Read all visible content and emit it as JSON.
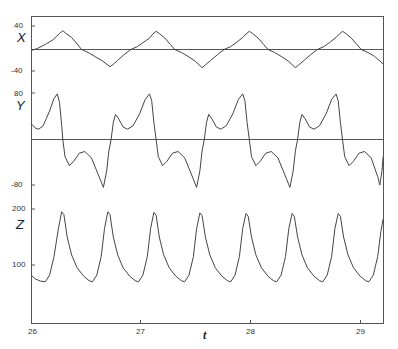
{
  "chart_data": {
    "type": "line",
    "title": "",
    "xlabel": "t",
    "xlim": [
      26,
      29.21
    ],
    "x_ticks": [
      26,
      27,
      28,
      29
    ],
    "grid": false,
    "legend": null,
    "panels": [
      {
        "name": "X",
        "label": "X",
        "ylim": [
          -40,
          40
        ],
        "y_ticks": [
          40,
          -40
        ],
        "zero_line": true,
        "series": [
          [
            26.0,
            -2
          ],
          [
            26.06,
            2
          ],
          [
            26.13,
            9
          ],
          [
            26.2,
            17
          ],
          [
            26.26,
            28
          ],
          [
            26.29,
            33
          ],
          [
            26.32,
            28
          ],
          [
            26.37,
            21
          ],
          [
            26.42,
            10
          ],
          [
            26.46,
            0
          ],
          [
            26.52,
            -5
          ],
          [
            26.58,
            -12
          ],
          [
            26.65,
            -20
          ],
          [
            26.72,
            -30
          ],
          [
            26.75,
            -26
          ],
          [
            26.79,
            -19
          ],
          [
            26.85,
            -9
          ],
          [
            26.91,
            0
          ],
          [
            26.97,
            5
          ],
          [
            27.02,
            12
          ],
          [
            27.08,
            20
          ],
          [
            27.11,
            27
          ],
          [
            27.14,
            32
          ],
          [
            27.17,
            28
          ],
          [
            27.22,
            20
          ],
          [
            27.27,
            9
          ],
          [
            27.31,
            0
          ],
          [
            27.37,
            -5
          ],
          [
            27.43,
            -12
          ],
          [
            27.5,
            -21
          ],
          [
            27.56,
            -32
          ],
          [
            27.59,
            -27
          ],
          [
            27.64,
            -19
          ],
          [
            27.7,
            -9
          ],
          [
            27.76,
            0
          ],
          [
            27.82,
            5
          ],
          [
            27.87,
            12
          ],
          [
            27.93,
            21
          ],
          [
            27.96,
            27
          ],
          [
            27.99,
            32
          ],
          [
            28.02,
            28
          ],
          [
            28.07,
            20
          ],
          [
            28.12,
            9
          ],
          [
            28.16,
            0
          ],
          [
            28.22,
            -5
          ],
          [
            28.28,
            -12
          ],
          [
            28.35,
            -21
          ],
          [
            28.41,
            -32
          ],
          [
            28.44,
            -27
          ],
          [
            28.49,
            -19
          ],
          [
            28.55,
            -9
          ],
          [
            28.61,
            0
          ],
          [
            28.67,
            5
          ],
          [
            28.72,
            12
          ],
          [
            28.78,
            21
          ],
          [
            28.81,
            27
          ],
          [
            28.84,
            32
          ],
          [
            28.87,
            28
          ],
          [
            28.92,
            20
          ],
          [
            28.97,
            9
          ],
          [
            29.01,
            0
          ],
          [
            29.07,
            -5
          ],
          [
            29.13,
            -12
          ],
          [
            29.21,
            -25
          ]
        ]
      },
      {
        "name": "Y",
        "label": "Y",
        "ylim": [
          -80,
          80
        ],
        "y_ticks": [
          80,
          -80
        ],
        "zero_line": true,
        "series": [
          [
            26.0,
            28
          ],
          [
            26.04,
            20
          ],
          [
            26.07,
            18
          ],
          [
            26.11,
            24
          ],
          [
            26.17,
            50
          ],
          [
            26.21,
            72
          ],
          [
            26.24,
            80
          ],
          [
            26.26,
            65
          ],
          [
            26.28,
            25
          ],
          [
            26.29,
            0
          ],
          [
            26.31,
            -30
          ],
          [
            26.35,
            -46
          ],
          [
            26.39,
            -38
          ],
          [
            26.44,
            -24
          ],
          [
            26.49,
            -21
          ],
          [
            26.55,
            -32
          ],
          [
            26.61,
            -60
          ],
          [
            26.66,
            -84
          ],
          [
            26.69,
            -55
          ],
          [
            26.71,
            -20
          ],
          [
            26.73,
            0
          ],
          [
            26.75,
            30
          ],
          [
            26.77,
            44
          ],
          [
            26.8,
            36
          ],
          [
            26.84,
            22
          ],
          [
            26.88,
            18
          ],
          [
            26.93,
            24
          ],
          [
            26.99,
            45
          ],
          [
            27.04,
            70
          ],
          [
            27.08,
            80
          ],
          [
            27.1,
            68
          ],
          [
            27.12,
            30
          ],
          [
            27.14,
            0
          ],
          [
            27.16,
            -30
          ],
          [
            27.2,
            -46
          ],
          [
            27.24,
            -38
          ],
          [
            27.29,
            -24
          ],
          [
            27.34,
            -21
          ],
          [
            27.4,
            -32
          ],
          [
            27.46,
            -60
          ],
          [
            27.51,
            -84
          ],
          [
            27.54,
            -55
          ],
          [
            27.56,
            -20
          ],
          [
            27.58,
            0
          ],
          [
            27.6,
            30
          ],
          [
            27.62,
            44
          ],
          [
            27.65,
            36
          ],
          [
            27.69,
            22
          ],
          [
            27.73,
            18
          ],
          [
            27.78,
            24
          ],
          [
            27.84,
            45
          ],
          [
            27.89,
            70
          ],
          [
            27.93,
            80
          ],
          [
            27.95,
            68
          ],
          [
            27.97,
            30
          ],
          [
            27.99,
            0
          ],
          [
            28.01,
            -30
          ],
          [
            28.05,
            -46
          ],
          [
            28.09,
            -38
          ],
          [
            28.14,
            -24
          ],
          [
            28.19,
            -21
          ],
          [
            28.25,
            -32
          ],
          [
            28.31,
            -60
          ],
          [
            28.36,
            -84
          ],
          [
            28.39,
            -55
          ],
          [
            28.41,
            -20
          ],
          [
            28.43,
            0
          ],
          [
            28.45,
            30
          ],
          [
            28.47,
            44
          ],
          [
            28.5,
            36
          ],
          [
            28.54,
            22
          ],
          [
            28.58,
            18
          ],
          [
            28.63,
            24
          ],
          [
            28.69,
            45
          ],
          [
            28.74,
            70
          ],
          [
            28.78,
            80
          ],
          [
            28.8,
            68
          ],
          [
            28.82,
            30
          ],
          [
            28.84,
            0
          ],
          [
            28.86,
            -30
          ],
          [
            28.9,
            -46
          ],
          [
            28.94,
            -38
          ],
          [
            28.99,
            -24
          ],
          [
            29.04,
            -21
          ],
          [
            29.1,
            -32
          ],
          [
            29.16,
            -65
          ],
          [
            29.18,
            -80
          ],
          [
            29.2,
            -55
          ],
          [
            29.21,
            -30
          ]
        ]
      },
      {
        "name": "Z",
        "label": "Z",
        "ylim": [
          0,
          200
        ],
        "y_ticks": [
          200,
          100
        ],
        "zero_line": false,
        "series": [
          [
            26.0,
            82
          ],
          [
            26.04,
            75
          ],
          [
            26.09,
            71
          ],
          [
            26.13,
            70
          ],
          [
            26.17,
            82
          ],
          [
            26.21,
            115
          ],
          [
            26.25,
            165
          ],
          [
            26.28,
            195
          ],
          [
            26.3,
            190
          ],
          [
            26.33,
            150
          ],
          [
            26.37,
            118
          ],
          [
            26.42,
            95
          ],
          [
            26.48,
            80
          ],
          [
            26.53,
            72
          ],
          [
            26.56,
            70
          ],
          [
            26.6,
            82
          ],
          [
            26.64,
            115
          ],
          [
            26.67,
            165
          ],
          [
            26.7,
            195
          ],
          [
            26.72,
            190
          ],
          [
            26.75,
            150
          ],
          [
            26.79,
            118
          ],
          [
            26.84,
            95
          ],
          [
            26.9,
            80
          ],
          [
            26.95,
            72
          ],
          [
            26.98,
            70
          ],
          [
            27.02,
            82
          ],
          [
            27.06,
            115
          ],
          [
            27.09,
            165
          ],
          [
            27.12,
            194
          ],
          [
            27.14,
            189
          ],
          [
            27.17,
            150
          ],
          [
            27.21,
            118
          ],
          [
            27.26,
            95
          ],
          [
            27.32,
            80
          ],
          [
            27.37,
            72
          ],
          [
            27.4,
            70
          ],
          [
            27.44,
            82
          ],
          [
            27.48,
            115
          ],
          [
            27.51,
            165
          ],
          [
            27.54,
            193
          ],
          [
            27.56,
            188
          ],
          [
            27.59,
            150
          ],
          [
            27.63,
            118
          ],
          [
            27.68,
            95
          ],
          [
            27.74,
            80
          ],
          [
            27.79,
            72
          ],
          [
            27.82,
            70
          ],
          [
            27.86,
            82
          ],
          [
            27.9,
            115
          ],
          [
            27.93,
            165
          ],
          [
            27.96,
            192
          ],
          [
            27.98,
            187
          ],
          [
            28.01,
            150
          ],
          [
            28.05,
            118
          ],
          [
            28.1,
            95
          ],
          [
            28.16,
            80
          ],
          [
            28.21,
            72
          ],
          [
            28.24,
            70
          ],
          [
            28.28,
            82
          ],
          [
            28.32,
            115
          ],
          [
            28.35,
            165
          ],
          [
            28.38,
            192
          ],
          [
            28.4,
            187
          ],
          [
            28.43,
            150
          ],
          [
            28.47,
            118
          ],
          [
            28.52,
            95
          ],
          [
            28.58,
            80
          ],
          [
            28.63,
            72
          ],
          [
            28.66,
            70
          ],
          [
            28.7,
            82
          ],
          [
            28.74,
            115
          ],
          [
            28.77,
            165
          ],
          [
            28.8,
            192
          ],
          [
            28.82,
            187
          ],
          [
            28.85,
            150
          ],
          [
            28.89,
            118
          ],
          [
            28.94,
            95
          ],
          [
            29.0,
            80
          ],
          [
            29.05,
            72
          ],
          [
            29.08,
            70
          ],
          [
            29.12,
            82
          ],
          [
            29.16,
            115
          ],
          [
            29.19,
            160
          ],
          [
            29.21,
            182
          ]
        ]
      }
    ]
  },
  "labels": {
    "x_title": "t",
    "x_tick_26": "26",
    "x_tick_27": "27",
    "x_tick_28": "28",
    "x_tick_29": "29",
    "X": "X",
    "Y": "Y",
    "Z": "Z",
    "X_top": "40",
    "X_bottom": "-40",
    "Y_top": "80",
    "Y_bottom": "-80",
    "Z_top": "200",
    "Z_mid": "100"
  },
  "colors": {
    "line": "#444444",
    "frame": "#555555",
    "background": "#ffffff"
  }
}
